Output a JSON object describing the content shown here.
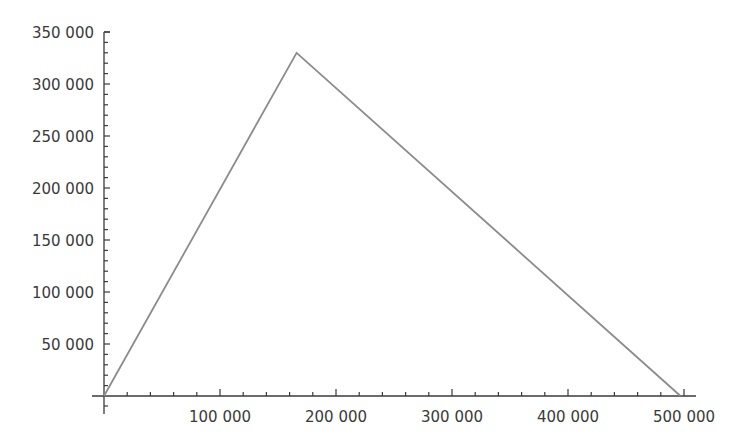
{
  "chart_data": {
    "type": "line",
    "title": "",
    "xlabel": "",
    "ylabel": "",
    "xlim": [
      0,
      500000
    ],
    "ylim": [
      0,
      350000
    ],
    "grid": false,
    "legend": null,
    "x_ticks": [
      "100 000",
      "200 000",
      "300 000",
      "400 000",
      "500 000"
    ],
    "y_ticks": [
      "50 000",
      "100 000",
      "150 000",
      "200 000",
      "250 000",
      "300 000",
      "350 000"
    ],
    "series": [
      {
        "name": "triangle",
        "color": "#8c8c8c",
        "points": [
          [
            0,
            0
          ],
          [
            166000,
            330000
          ],
          [
            497000,
            0
          ]
        ]
      }
    ]
  },
  "style": {
    "axis_color": "#3a3a3a",
    "line_color": "#8c8c8c"
  }
}
